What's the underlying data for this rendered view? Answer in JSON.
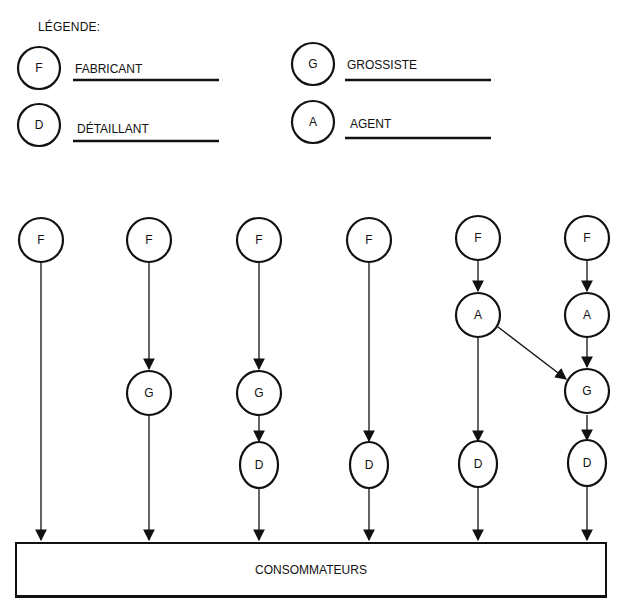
{
  "legend": {
    "title": "LÉGENDE:",
    "items": [
      {
        "symbol": "F",
        "label": "FABRICANT"
      },
      {
        "symbol": "G",
        "label": "GROSSISTE"
      },
      {
        "symbol": "D",
        "label": "DÉTAILLANT"
      },
      {
        "symbol": "A",
        "label": "AGENT"
      }
    ]
  },
  "channels": [
    {
      "nodes": [
        "F"
      ]
    },
    {
      "nodes": [
        "F",
        "G"
      ]
    },
    {
      "nodes": [
        "F",
        "G",
        "D"
      ]
    },
    {
      "nodes": [
        "F",
        "D"
      ]
    },
    {
      "nodes": [
        "F",
        "A",
        "D"
      ],
      "extra_edge": "A → G (channel 6)"
    },
    {
      "nodes": [
        "F",
        "A",
        "G",
        "D"
      ]
    }
  ],
  "consumers": {
    "label": "CONSOMMATEURS"
  },
  "colors": {
    "stroke": "#111111",
    "background": "#ffffff"
  }
}
